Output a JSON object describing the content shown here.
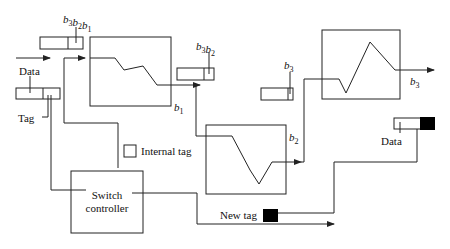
{
  "diagram": {
    "labels": {
      "input_data": "Data",
      "input_tag": "Tag",
      "register_top_left": "b3b2b1",
      "register_mid": "b3b2",
      "register_right": "b3",
      "output_b1": "b1",
      "output_b2": "b2",
      "output_b3": "b3",
      "internal_tag_legend": "Internal tag",
      "switch_controller_line1": "Switch",
      "switch_controller_line2": "controller",
      "new_tag": "New tag",
      "output_data": "Data"
    },
    "colors": {
      "line": "#222222",
      "tag_fill": "#000000",
      "background": "#ffffff"
    },
    "blocks": [
      {
        "id": "block-1",
        "output": "b1"
      },
      {
        "id": "block-2",
        "output": "b2"
      },
      {
        "id": "block-3",
        "output": "b3"
      }
    ]
  }
}
